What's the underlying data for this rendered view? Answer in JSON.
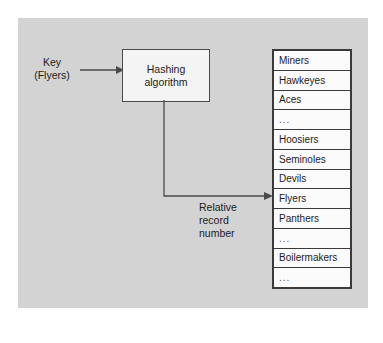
{
  "figure": {
    "background_color": "#ffffff",
    "panel_color": "#d3d3d3",
    "line_color": "#4a4a4a",
    "text_color": "#1b1b1b"
  },
  "key": {
    "line1": "Key",
    "line2": "(Flyers)"
  },
  "hashing_box": {
    "line1": "Hashing",
    "line2": "algorithm"
  },
  "relative_record_number": {
    "line1": "Relative",
    "line2": "record",
    "line3": "number"
  },
  "record_list": {
    "rows": [
      {
        "label": "Miners",
        "is_ellipsis": false
      },
      {
        "label": "Hawkeyes",
        "is_ellipsis": false
      },
      {
        "label": "Aces",
        "is_ellipsis": false
      },
      {
        "label": "...",
        "is_ellipsis": true
      },
      {
        "label": "Hoosiers",
        "is_ellipsis": false
      },
      {
        "label": "Seminoles",
        "is_ellipsis": false
      },
      {
        "label": "Devils",
        "is_ellipsis": false
      },
      {
        "label": "Flyers",
        "is_ellipsis": false
      },
      {
        "label": "Panthers",
        "is_ellipsis": false
      },
      {
        "label": "...",
        "is_ellipsis": true
      },
      {
        "label": "Boilermakers",
        "is_ellipsis": false
      },
      {
        "label": "...",
        "is_ellipsis": true
      }
    ],
    "target_row_index": 7
  }
}
